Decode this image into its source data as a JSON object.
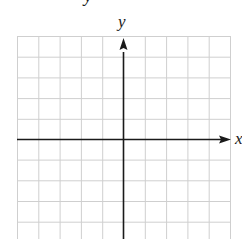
{
  "diagram": {
    "type": "coordinate-grid",
    "title_fragment": "y",
    "x_axis_label": "x",
    "y_axis_label": "y",
    "grid": {
      "left": 17,
      "top": 36,
      "right": 230,
      "bottom": 239,
      "cols": 10,
      "rows_visible": 10,
      "cell_size": 21.3,
      "line_color": "#c8c8c8",
      "line_style": "dotted-light"
    },
    "origin": {
      "x": 123,
      "y": 139
    },
    "axes": {
      "color": "#1a1a1a",
      "x_arrow": "right",
      "y_arrow": "up"
    }
  }
}
